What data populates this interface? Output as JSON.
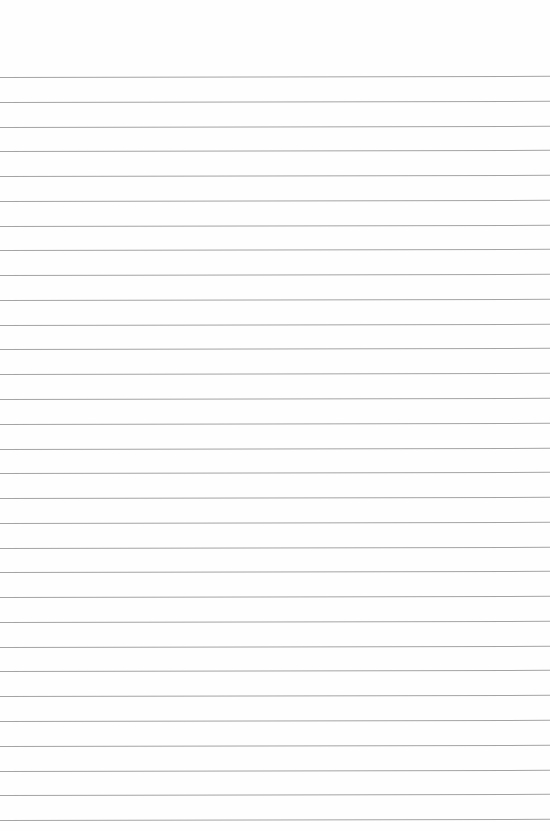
{
  "paper": {
    "background": "#fefefe",
    "rule_color": "#a4a4a4",
    "first_rule_y": 77,
    "rule_spacing": 24.77,
    "rule_count": 31
  }
}
